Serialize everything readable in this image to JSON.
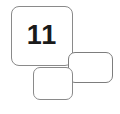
{
  "diagram": {
    "type": "overlapping-rounded-rectangles",
    "background_color": "#ffffff",
    "border_color": "#8a8a8a",
    "text_color": "#1a1a1a",
    "cards": [
      {
        "name": "numbered-card",
        "label": "11",
        "has_label": true,
        "x": 11,
        "y": 6,
        "width": 62,
        "height": 60,
        "z": 1
      },
      {
        "name": "right-card",
        "label": "",
        "has_label": false,
        "x": 68,
        "y": 52,
        "width": 45,
        "height": 31,
        "z": 2
      },
      {
        "name": "bottom-card",
        "label": "",
        "has_label": false,
        "x": 33,
        "y": 67,
        "width": 40,
        "height": 33,
        "z": 3
      }
    ]
  }
}
